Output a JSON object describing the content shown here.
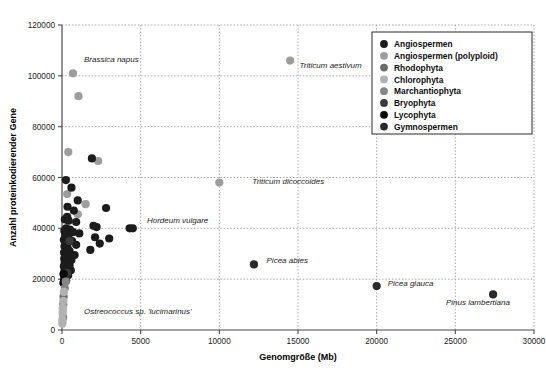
{
  "chart_data": {
    "type": "scatter",
    "title": "",
    "xlabel": "Genomgröße (Mb)",
    "ylabel": "Anzahl proteinkodierender Gene",
    "xlim": [
      0,
      30000
    ],
    "ylim": [
      0,
      120000
    ],
    "xticks": [
      "0",
      "5000",
      "10000",
      "15000",
      "20000",
      "25000",
      "30000"
    ],
    "xtick_values": [
      0,
      5000,
      10000,
      15000,
      20000,
      25000,
      30000
    ],
    "yticks": [
      "0",
      "20000",
      "40000",
      "60000",
      "80000",
      "100000",
      "120000"
    ],
    "ytick_values": [
      0,
      20000,
      40000,
      60000,
      80000,
      100000,
      120000
    ],
    "grid": true,
    "legend_position": "top-right",
    "legend": [
      {
        "name": "Angiospermen",
        "color": "#1c1c1c"
      },
      {
        "name": "Angiospermen (polyploid)",
        "color": "#9d9d9d"
      },
      {
        "name": "Rhodophyta",
        "color": "#6a6a6a"
      },
      {
        "name": "Chlorophyta",
        "color": "#b2b2b2"
      },
      {
        "name": "Marchantiophyta",
        "color": "#868686"
      },
      {
        "name": "Bryophyta",
        "color": "#3a3a3a"
      },
      {
        "name": "Lycophyta",
        "color": "#0a0a0a"
      },
      {
        "name": "Gymnospermen",
        "color": "#2a2a2a"
      }
    ],
    "annotations": [
      {
        "text": "Brassica napus",
        "x": 1400,
        "y": 105500,
        "anchor": "start"
      },
      {
        "text": "Triticum aestivum",
        "x": 15100,
        "y": 103200,
        "anchor": "start"
      },
      {
        "text": "Triticum dicoccoides",
        "x": 12100,
        "y": 57500,
        "anchor": "start"
      },
      {
        "text": "Hordeum vulgare",
        "x": 5400,
        "y": 42200,
        "anchor": "start"
      },
      {
        "text": "Picea abies",
        "x": 13000,
        "y": 26200,
        "anchor": "start"
      },
      {
        "text": "Picea glauca",
        "x": 20700,
        "y": 17500,
        "anchor": "start"
      },
      {
        "text": "Pinus lambertiana",
        "x": 24400,
        "y": 9700,
        "anchor": "start"
      },
      {
        "text": "Ostreococcus sp. 'lucimarinus'",
        "x": 1400,
        "y": 6300,
        "anchor": "start"
      }
    ],
    "series": [
      {
        "name": "Angiospermen (polyploid)",
        "color": "#9d9d9d",
        "points": [
          [
            700,
            101000
          ],
          [
            1050,
            92000
          ],
          [
            400,
            70000
          ],
          [
            2300,
            66500
          ],
          [
            330,
            53500
          ],
          [
            1500,
            49500
          ],
          [
            1000,
            45500
          ],
          [
            14500,
            106000
          ],
          [
            10000,
            58000
          ]
        ]
      },
      {
        "name": "Angiospermen",
        "color": "#1c1c1c",
        "points": [
          [
            1900,
            67500
          ],
          [
            250,
            59000
          ],
          [
            600,
            56000
          ],
          [
            1000,
            51000
          ],
          [
            350,
            48500
          ],
          [
            750,
            47000
          ],
          [
            2800,
            48000
          ],
          [
            330,
            44500
          ],
          [
            180,
            43500
          ],
          [
            420,
            43000
          ],
          [
            900,
            42500
          ],
          [
            2000,
            41000
          ],
          [
            2200,
            40500
          ],
          [
            4300,
            40000
          ],
          [
            4500,
            40000
          ],
          [
            260,
            40000
          ],
          [
            500,
            39500
          ],
          [
            150,
            39000
          ],
          [
            700,
            38500
          ],
          [
            1100,
            38000
          ],
          [
            2100,
            36500
          ],
          [
            3000,
            36000
          ],
          [
            300,
            37500
          ],
          [
            200,
            37000
          ],
          [
            430,
            36000
          ],
          [
            120,
            35500
          ],
          [
            640,
            35000
          ],
          [
            2400,
            34000
          ],
          [
            900,
            33500
          ],
          [
            160,
            33000
          ],
          [
            350,
            32500
          ],
          [
            250,
            32000
          ],
          [
            1800,
            31500
          ],
          [
            480,
            31000
          ],
          [
            130,
            30500
          ],
          [
            300,
            30000
          ],
          [
            800,
            29500
          ],
          [
            220,
            29000
          ],
          [
            410,
            28500
          ],
          [
            140,
            28000
          ],
          [
            600,
            27500
          ],
          [
            310,
            27000
          ],
          [
            170,
            26500
          ],
          [
            260,
            26000
          ],
          [
            480,
            25500
          ],
          [
            120,
            25000
          ],
          [
            340,
            24500
          ],
          [
            200,
            24000
          ],
          [
            560,
            23500
          ],
          [
            150,
            23000
          ],
          [
            280,
            22500
          ],
          [
            100,
            22000
          ],
          [
            390,
            21500
          ],
          [
            180,
            21000
          ],
          [
            240,
            20500
          ],
          [
            130,
            20000
          ]
        ]
      },
      {
        "name": "Gymnospermen",
        "color": "#2a2a2a",
        "points": [
          [
            12200,
            25800
          ],
          [
            20000,
            17300
          ],
          [
            27400,
            14000
          ]
        ]
      },
      {
        "name": "Bryophyta",
        "color": "#3a3a3a",
        "points": [
          [
            480,
            35000
          ],
          [
            270,
            19500
          ],
          [
            330,
            22500
          ]
        ]
      },
      {
        "name": "Lycophyta",
        "color": "#0a0a0a",
        "points": [
          [
            110,
            22000
          ],
          [
            90,
            18500
          ]
        ]
      },
      {
        "name": "Marchantiophyta",
        "color": "#868686",
        "points": [
          [
            240,
            19000
          ],
          [
            180,
            16500
          ]
        ]
      },
      {
        "name": "Rhodophyta",
        "color": "#6a6a6a",
        "points": [
          [
            100,
            13000
          ],
          [
            80,
            10000
          ],
          [
            60,
            8500
          ],
          [
            70,
            5000
          ]
        ]
      },
      {
        "name": "Chlorophyta",
        "color": "#b2b2b2",
        "points": [
          [
            120,
            15000
          ],
          [
            90,
            11500
          ],
          [
            60,
            9000
          ],
          [
            40,
            6500
          ],
          [
            30,
            4200
          ],
          [
            20,
            2500
          ],
          [
            50,
            7500
          ],
          [
            35,
            3200
          ]
        ]
      }
    ]
  }
}
